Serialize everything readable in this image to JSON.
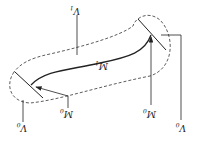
{
  "diagram": {
    "orientation": "rotated 180 degrees",
    "labels": {
      "v1": {
        "main": "V",
        "sub": "1"
      },
      "m1": {
        "main": "M",
        "sub": "1"
      },
      "m0_left": {
        "main": "M",
        "sub": "0"
      },
      "m0_right": {
        "main": "M",
        "sub": "0"
      },
      "v0_left": {
        "main": "V",
        "sub": "0"
      },
      "v0_right": {
        "main": "V",
        "sub": "0"
      }
    },
    "colors": {
      "stroke": "#222222",
      "background": "#ffffff"
    }
  }
}
